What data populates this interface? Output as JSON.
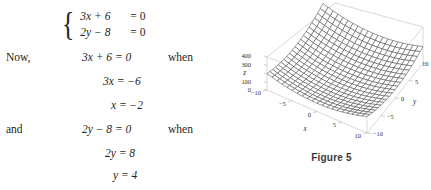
{
  "worklines": {
    "system": {
      "rows": [
        {
          "lhs": "3x + 6",
          "rhs": "= 0"
        },
        {
          "lhs": "2y − 8",
          "rhs": "= 0"
        }
      ]
    },
    "now_label": "Now,",
    "and_label": "and",
    "when_label_1": "when",
    "when_label_2": "when",
    "eq_now": "3x + 6 = 0",
    "eq_now_step1": "3x = −6",
    "eq_now_step2": "x = −2",
    "eq_and": "2y − 8 = 0",
    "eq_and_step1": "2y = 8",
    "eq_and_step2": "y = 4"
  },
  "figure": {
    "caption": "Figure 5",
    "chart_data": {
      "type": "surface",
      "title": "",
      "equation": "z = x^2 + y^2",
      "xlabel": "x",
      "ylabel": "y",
      "zlabel": "z",
      "xlim": [
        -10,
        10
      ],
      "ylim": [
        -10,
        10
      ],
      "zlim": [
        0,
        400
      ],
      "x_ticks": [
        "−10",
        "−5",
        "0",
        "5",
        "10"
      ],
      "y_ticks": [
        "−10",
        "−5",
        "0",
        "5",
        "10"
      ],
      "z_ticks": [
        "0",
        "100",
        "200",
        "300",
        "400"
      ],
      "z_ticks_visible": [
        "0",
        "100",
        "300",
        "400"
      ],
      "grid": true,
      "legend": "none",
      "mesh_color": "#4a4a4a",
      "box_color": "#c9c9c9",
      "surface_fill": "#ffffff",
      "grid_steps": 20
    }
  },
  "colors": {
    "ink": "#231f20",
    "caption": "#3a3a3a",
    "box": "#c9c9c9",
    "mesh": "#4a4a4a"
  }
}
